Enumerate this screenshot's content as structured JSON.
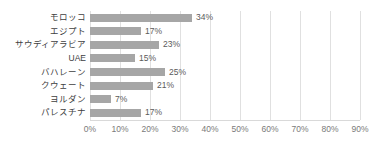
{
  "chart_data": {
    "type": "bar",
    "orientation": "horizontal",
    "title": "",
    "subtitle": "",
    "xlabel": "",
    "ylabel": "",
    "xlim": [
      0,
      90
    ],
    "xtick_step": 10,
    "grid": true,
    "legend": false,
    "value_suffix": "%",
    "bar_color": "#a6a6a6",
    "gridline_color": "#e0e0e0",
    "categories": [
      "モロッコ",
      "エジプト",
      "サウディアラビア",
      "UAE",
      "バハレーン",
      "クウェート",
      "ヨルダン",
      "パレスチナ"
    ],
    "values": [
      34,
      17,
      23,
      15,
      25,
      21,
      7,
      17
    ],
    "data_labels": [
      "34%",
      "17%",
      "23%",
      "15%",
      "25%",
      "21%",
      "7%",
      "17%"
    ],
    "xticklabels": [
      "0%",
      "10%",
      "20%",
      "30%",
      "40%",
      "50%",
      "60%",
      "70%",
      "80%",
      "90%"
    ],
    "xtickvalues": [
      0,
      10,
      20,
      30,
      40,
      50,
      60,
      70,
      80,
      90
    ]
  }
}
